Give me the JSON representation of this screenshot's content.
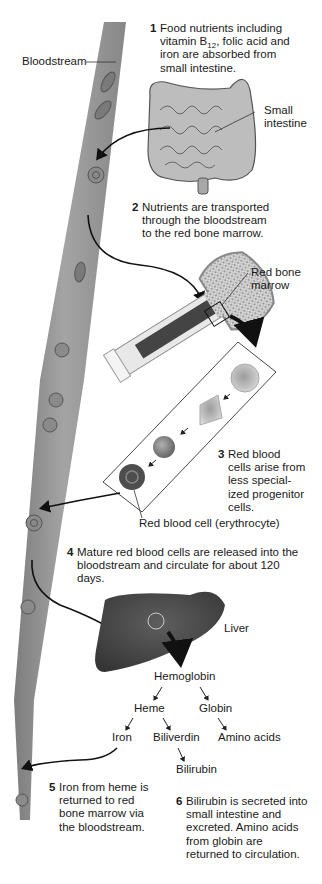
{
  "diagram": {
    "labels": {
      "bloodstream": "Bloodstream",
      "small_intestine": [
        "Small",
        "intestine"
      ],
      "red_bone_marrow": [
        "Red bone",
        "marrow"
      ],
      "red_blood_cell": "Red blood cell (erythrocyte)",
      "liver": "Liver"
    },
    "steps": [
      {
        "number": "1",
        "lines": [
          "Food nutrients including",
          "vitamin B",
          "iron are absorbed from",
          "small intestine."
        ],
        "subscript": "12",
        "after_subscript": ", folic acid and"
      },
      {
        "number": "2",
        "lines": [
          "Nutrients are transported",
          "through the bloodstream",
          "to the red bone marrow."
        ]
      },
      {
        "number": "3",
        "lines": [
          "Red blood",
          "cells arise from",
          "less special-",
          "ized progenitor",
          "cells."
        ]
      },
      {
        "number": "4",
        "lines": [
          "Mature red blood cells are released into the",
          "bloodstream and circulate for about 120",
          "days."
        ]
      },
      {
        "number": "5",
        "lines": [
          "Iron from heme is",
          "returned to red",
          "bone marrow via",
          "the bloodstream."
        ]
      },
      {
        "number": "6",
        "lines": [
          "Bilirubin is secreted into",
          "small intestine and",
          "excreted. Amino acids",
          "from globin are",
          "returned to circulation."
        ]
      }
    ],
    "breakdown": {
      "hemoglobin": "Hemoglobin",
      "heme": "Heme",
      "globin": "Globin",
      "iron": "Iron",
      "biliverdin": "Biliverdin",
      "amino_acids": "Amino acids",
      "bilirubin": "Bilirubin"
    },
    "colors": {
      "vessel": "#8a8a8a",
      "cell": "#6e6e6e",
      "liver": "#4a4a4a",
      "text": "#1a1a1a"
    }
  }
}
